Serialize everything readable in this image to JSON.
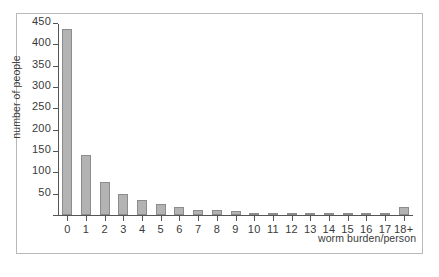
{
  "chart_data": {
    "type": "bar",
    "title": "",
    "xlabel": "worm burden/person",
    "ylabel": "number of people",
    "categories": [
      "0",
      "1",
      "2",
      "3",
      "4",
      "5",
      "6",
      "7",
      "8",
      "9",
      "10",
      "11",
      "12",
      "13",
      "14",
      "15",
      "16",
      "17",
      "18+"
    ],
    "values": [
      437,
      141,
      78,
      49,
      35,
      26,
      19,
      12,
      11,
      10,
      4,
      4,
      4,
      4,
      4,
      4,
      4,
      5,
      18
    ],
    "ylim": [
      0,
      450
    ],
    "yticks": [
      0,
      50,
      100,
      150,
      200,
      250,
      300,
      350,
      400,
      450
    ],
    "ytick_labels": [
      "",
      "50",
      "100",
      "150",
      "200",
      "250",
      "300",
      "350",
      "400",
      "450"
    ],
    "grid": false,
    "legend": "none",
    "bar_color": "#b3b3b3",
    "bar_edge_color": "#8c8c8c",
    "axis_color": "#555555",
    "text_color": "#3a3a3a",
    "frame_color": "#b9b9b9",
    "background": "#ffffff"
  }
}
